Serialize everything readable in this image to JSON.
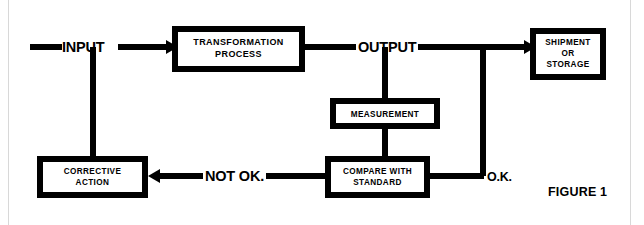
{
  "figure": {
    "caption": "FIGURE 1"
  },
  "colors": {
    "ink": "#000000",
    "paper": "#ffffff",
    "scan_rule": "#d8d8d8"
  },
  "nodes": [
    {
      "id": "transformation-process",
      "lines": [
        "TRANSFORMATION",
        "PROCESS"
      ],
      "x": 172,
      "y": 26,
      "w": 133,
      "h": 46,
      "font": "sz-9"
    },
    {
      "id": "shipment-or-storage",
      "lines": [
        "SHIPMENT",
        "OR",
        "STORAGE"
      ],
      "x": 530,
      "y": 28,
      "w": 76,
      "h": 52,
      "font": "sz-8"
    },
    {
      "id": "measurement",
      "lines": [
        "MEASUREMENT"
      ],
      "x": 330,
      "y": 98,
      "w": 110,
      "h": 31,
      "font": "sz-8"
    },
    {
      "id": "compare-with-standard",
      "lines": [
        "COMPARE WITH",
        "STANDARD"
      ],
      "x": 325,
      "y": 156,
      "w": 105,
      "h": 42,
      "font": "sz-8"
    },
    {
      "id": "corrective-action",
      "lines": [
        "CORRECTIVE",
        "ACTION"
      ],
      "x": 37,
      "y": 156,
      "w": 111,
      "h": 42,
      "font": "sz-8"
    }
  ],
  "flow_labels": [
    {
      "id": "input-label",
      "text": "INPUT",
      "x": 62,
      "y": 52
    },
    {
      "id": "output-label",
      "text": "OUTPUT",
      "x": 358,
      "y": 52
    },
    {
      "id": "not-ok-label",
      "text": "NOT OK.",
      "x": 211,
      "y": 180
    },
    {
      "id": "ok-label",
      "text": "O.K.",
      "x": 489,
      "y": 181
    }
  ],
  "edges": [
    {
      "id": "edge-input-to-transformation",
      "from": "input-source",
      "to": "transformation-process",
      "label": "INPUT"
    },
    {
      "id": "edge-input-branch-down",
      "from": "input-line",
      "to": "corrective-action"
    },
    {
      "id": "edge-transformation-to-output",
      "from": "transformation-process",
      "to": "output-line",
      "label": "OUTPUT"
    },
    {
      "id": "edge-output-to-shipment",
      "from": "output-line",
      "to": "shipment-or-storage"
    },
    {
      "id": "edge-output-branch-to-measurement",
      "from": "output-line",
      "to": "measurement"
    },
    {
      "id": "edge-measurement-to-compare",
      "from": "measurement",
      "to": "compare-with-standard"
    },
    {
      "id": "edge-compare-to-corrective",
      "from": "compare-with-standard",
      "to": "corrective-action",
      "label": "NOT OK."
    },
    {
      "id": "edge-compare-to-output-loop",
      "from": "compare-with-standard",
      "to": "output-line",
      "label": "O.K."
    }
  ]
}
